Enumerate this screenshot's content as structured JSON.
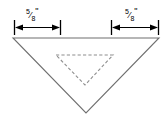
{
  "diagram": {
    "background_color": "#ffffff",
    "stroke_color": "#6f6f6f",
    "dimension_color": "#000000",
    "dashed_color": "#8e8e8e",
    "dimensions": [
      {
        "id": "left-dimension",
        "numerator": "5",
        "solidus": "⁄",
        "denominator": "8",
        "unit": "\"",
        "text": "5/8\"",
        "from_x": 14,
        "to_x": 61,
        "line_y": 27
      },
      {
        "id": "right-dimension",
        "numerator": "5",
        "solidus": "⁄",
        "denominator": "8",
        "unit": "\"",
        "text": "5/8\"",
        "from_x": 111,
        "to_x": 159,
        "line_y": 27
      }
    ],
    "outer_triangle": {
      "id": "outer-triangle",
      "style": "solid",
      "points": "13,38 159,38 86,113"
    },
    "inner_triangle": {
      "id": "inner-triangle",
      "style": "dashed",
      "points": "56,55 113,55 85,85"
    }
  }
}
